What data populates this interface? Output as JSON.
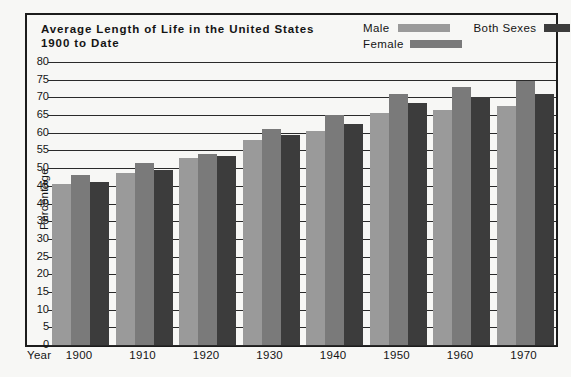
{
  "chart_data": {
    "type": "bar",
    "title": "Average Length of Life in the United States",
    "subtitle": "1900 to Date",
    "xlabel": "Year",
    "ylabel": "Percentage",
    "categories": [
      "1900",
      "1910",
      "1920",
      "1930",
      "1940",
      "1950",
      "1960",
      "1970"
    ],
    "series": [
      {
        "name": "Male",
        "color": "#9a9a9a",
        "values": [
          45.5,
          48.5,
          53.0,
          58.0,
          60.5,
          65.5,
          66.5,
          67.5
        ]
      },
      {
        "name": "Female",
        "color": "#7a7a7a",
        "values": [
          48.0,
          51.5,
          54.0,
          61.0,
          65.0,
          71.0,
          73.0,
          74.5
        ]
      },
      {
        "name": "Both Sexes",
        "color": "#3c3c3c",
        "values": [
          46.0,
          49.5,
          53.5,
          59.5,
          62.5,
          68.5,
          70.0,
          71.0
        ]
      }
    ],
    "ylim": [
      0,
      80
    ],
    "ytick_step": 5,
    "yticks": [
      "80",
      "75",
      "70",
      "65",
      "60",
      "55",
      "50",
      "45",
      "40",
      "35",
      "30",
      "25",
      "20",
      "15",
      "10",
      "5",
      "0"
    ],
    "grid": true,
    "legend_position": "top-right"
  },
  "legend": {
    "male_label": "Male",
    "female_label": "Female",
    "both_label": "Both  Sexes"
  },
  "axis": {
    "year_word": "Year"
  }
}
